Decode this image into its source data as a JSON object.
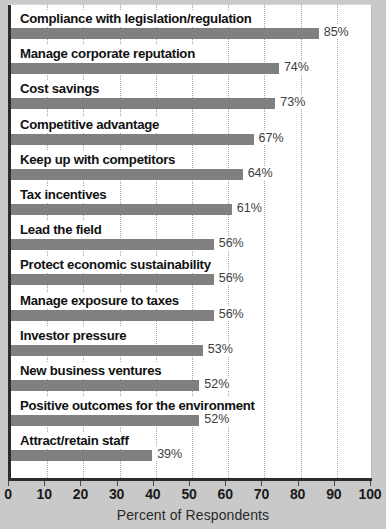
{
  "chart_data": {
    "type": "bar",
    "orientation": "horizontal",
    "title": "",
    "xlabel": "Percent of Respondents",
    "ylabel": "",
    "xlim": [
      0,
      100
    ],
    "xticks": [
      "0",
      "10",
      "20",
      "30",
      "40",
      "50",
      "60",
      "70",
      "80",
      "90",
      "100"
    ],
    "grid": true,
    "legend": null,
    "categories": [
      "Compliance with legislation/regulation",
      "Manage corporate reputation",
      "Cost savings",
      "Competitive advantage",
      "Keep up with competitors",
      "Tax incentives",
      "Lead the field",
      "Protect economic sustainability",
      "Manage exposure to taxes",
      "Investor pressure",
      "New business ventures",
      "Positive outcomes for the environment",
      "Attract/retain staff"
    ],
    "values": [
      85,
      74,
      73,
      67,
      64,
      61,
      56,
      56,
      56,
      53,
      52,
      52,
      39
    ],
    "value_labels": [
      "85%",
      "74%",
      "73%",
      "67%",
      "64%",
      "61%",
      "56%",
      "56%",
      "56%",
      "53%",
      "52%",
      "52%",
      "39%"
    ],
    "bar_color": "#808080",
    "axis_color": "#2b2b2b",
    "gridline_color": "#a8a8a8",
    "plot_background": "#ffffff",
    "page_background": "#c9c9c9"
  }
}
